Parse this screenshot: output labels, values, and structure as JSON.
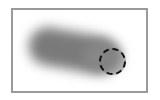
{
  "canvas": {
    "frame_border_color": "#9a9a9a",
    "background_color": "#ffffff"
  },
  "brush_stroke": {
    "color": "#7a7a7a",
    "style": "blurred"
  },
  "cursor": {
    "shape": "circle",
    "border": "dashed",
    "border_color": "#111111"
  }
}
